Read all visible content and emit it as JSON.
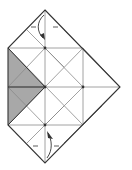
{
  "diagram": {
    "type": "origami-crease-pattern",
    "colors": {
      "line": "#333333",
      "crease": "#888888",
      "shade": "#a8a8a8",
      "background": "#ffffff"
    },
    "arrows": [
      {
        "position": "top",
        "kind": "fold-arrow"
      },
      {
        "position": "bottom",
        "kind": "fold-arrow"
      }
    ],
    "shaded_region": "left-triangle"
  }
}
